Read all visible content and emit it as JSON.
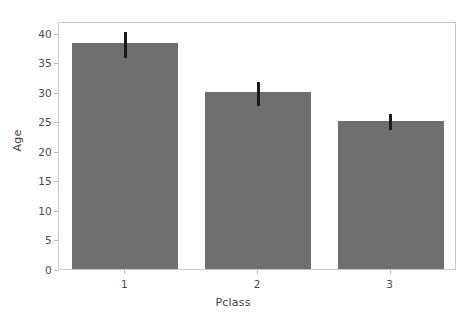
{
  "chart_data": {
    "type": "bar",
    "title": "",
    "subtitle": "",
    "xlabel": "Pclass",
    "ylabel": "Age",
    "categories": [
      "1",
      "2",
      "3"
    ],
    "values": [
      38.2,
      29.9,
      25.1
    ],
    "error_bars": {
      "type": "confidence-interval",
      "lower": [
        36.0,
        27.9,
        23.8
      ],
      "upper": [
        40.4,
        32.0,
        26.6
      ]
    },
    "series": [
      {
        "name": "Age",
        "values": [
          38.2,
          29.9,
          25.1
        ]
      }
    ],
    "ylim": [
      0,
      42
    ],
    "xlim": [
      -0.5,
      2.5
    ],
    "yticks": [
      0,
      5,
      10,
      15,
      20,
      25,
      30,
      35,
      40
    ],
    "ytick_labels": [
      "0",
      "5",
      "10",
      "15",
      "20",
      "25",
      "30",
      "35",
      "40"
    ],
    "xtick_labels": [
      "1",
      "2",
      "3"
    ],
    "grid": false,
    "legend": null,
    "legend_position": "none",
    "bar_color": "#6f6f6f",
    "errorbar_color": "#1b1b1b",
    "axes_border_color": "#c9c9c9",
    "background_color": "#ffffff",
    "tick_text_color": "#4a4a4a",
    "label_text_color": "#3d3d3d"
  }
}
